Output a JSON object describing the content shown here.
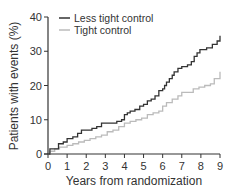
{
  "chart_data": {
    "type": "line",
    "subtype": "kaplan-meier-step",
    "title": "",
    "xlabel": "Years from randomization",
    "ylabel": "Patients with events (%)",
    "xlim": [
      0,
      9
    ],
    "ylim": [
      0,
      40
    ],
    "xticks": [
      "0",
      "1",
      "2",
      "3",
      "4",
      "5",
      "6",
      "7",
      "8",
      "9"
    ],
    "yticks": [
      "0",
      "10",
      "20",
      "30",
      "40"
    ],
    "grid": false,
    "legend_position": "top-left",
    "series": [
      {
        "name": "Less tight control",
        "color": "#333333",
        "x": [
          0,
          0.1,
          0.45,
          0.55,
          0.8,
          1.0,
          1.3,
          1.55,
          1.75,
          2.3,
          2.55,
          2.8,
          3.6,
          3.85,
          4.0,
          4.15,
          4.3,
          4.55,
          4.8,
          5.0,
          5.2,
          5.4,
          5.6,
          5.8,
          6.0,
          6.1,
          6.2,
          6.35,
          6.5,
          6.6,
          6.8,
          7.0,
          7.3,
          7.5,
          7.65,
          7.8,
          7.95,
          8.3,
          8.6,
          8.85,
          9.0
        ],
        "y": [
          0,
          1.5,
          1.5,
          3.0,
          3.5,
          4.5,
          5.0,
          6.0,
          7.0,
          7.5,
          8.0,
          9.0,
          9.5,
          10.0,
          11.5,
          12.0,
          12.5,
          13.0,
          14.0,
          14.5,
          15.5,
          16.0,
          17.0,
          18.5,
          19.0,
          20.0,
          21.0,
          22.0,
          23.0,
          24.0,
          25.0,
          25.5,
          26.0,
          27.0,
          28.5,
          29.5,
          30.5,
          31.0,
          32.0,
          33.0,
          34.5
        ]
      },
      {
        "name": "Tight control",
        "color": "#bbbbbb",
        "x": [
          0,
          0.1,
          0.35,
          0.6,
          1.0,
          1.3,
          1.6,
          1.9,
          2.2,
          2.5,
          2.8,
          3.1,
          3.4,
          3.7,
          4.0,
          4.3,
          4.6,
          4.9,
          5.2,
          5.5,
          5.8,
          6.0,
          6.2,
          6.5,
          6.8,
          7.0,
          7.3,
          7.6,
          7.9,
          8.2,
          8.5,
          8.7,
          9.0
        ],
        "y": [
          0,
          0.8,
          1.5,
          2.0,
          2.5,
          3.0,
          3.5,
          4.0,
          4.5,
          5.0,
          5.5,
          6.5,
          7.0,
          8.0,
          9.0,
          9.5,
          10.0,
          10.5,
          11.5,
          12.0,
          12.5,
          14.0,
          15.0,
          16.0,
          17.0,
          18.0,
          18.0,
          19.0,
          19.5,
          20.0,
          20.5,
          22.0,
          24.0
        ]
      }
    ]
  }
}
